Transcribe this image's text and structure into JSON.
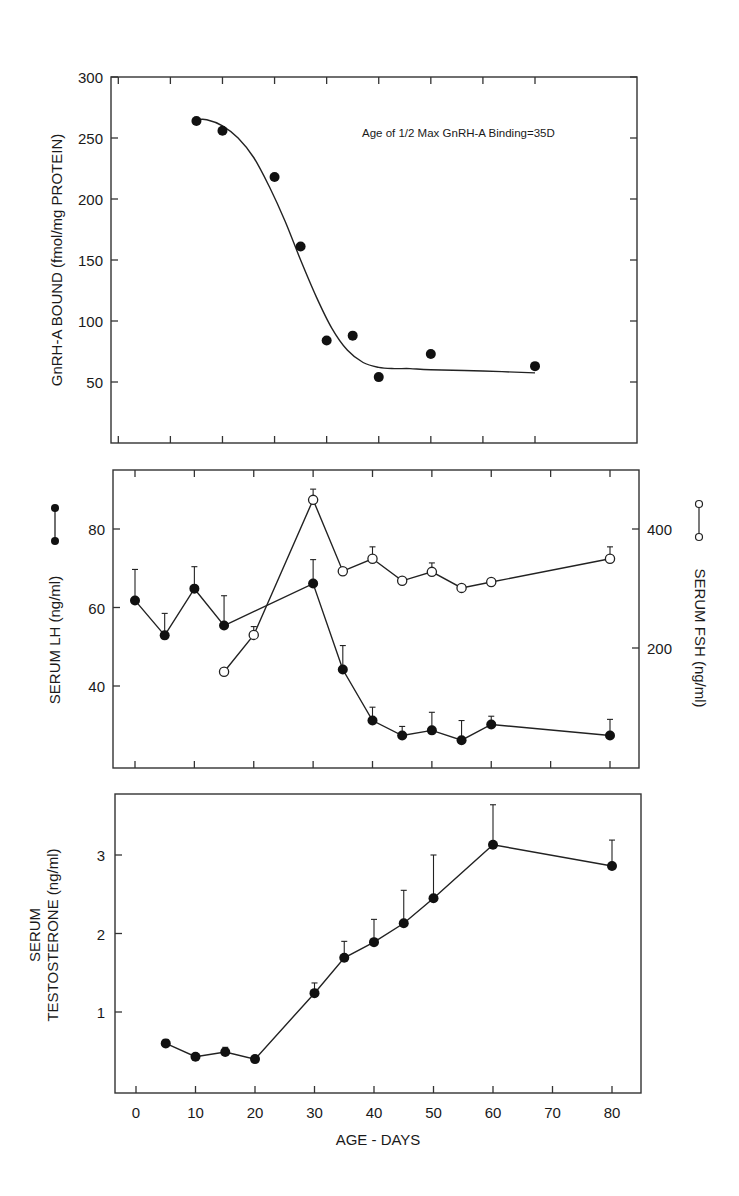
{
  "chart_data": [
    {
      "type": "scatter",
      "panel": "top",
      "title": "",
      "xlabel": "",
      "ylabel": "GnRH-A BOUND (fmol/mg PROTEIN)",
      "ylim": [
        0,
        300
      ],
      "yticks": [
        50,
        100,
        150,
        200,
        250,
        300
      ],
      "xlim": [
        -2,
        99
      ],
      "xticks": [
        0,
        10,
        20,
        30,
        40,
        50,
        60,
        70,
        80
      ],
      "xtick_labels_shown": false,
      "annotation": "Age of 1/2 Max GnRH-A Binding=35D",
      "series": [
        {
          "name": "GnRH-A bound",
          "marker": "filled-circle",
          "x": [
            15,
            20,
            30,
            35,
            40,
            45,
            50,
            60,
            80
          ],
          "values": [
            264,
            256,
            218,
            161,
            84,
            88,
            54,
            73,
            63
          ]
        }
      ],
      "fit_curve": {
        "name": "sigmoid fit",
        "x": [
          15,
          17,
          20,
          23,
          26,
          29,
          32,
          35,
          38,
          41,
          44,
          47,
          50,
          53,
          56,
          60,
          70,
          80
        ],
        "values": [
          265,
          265,
          260,
          250,
          234,
          210,
          182,
          150,
          120,
          94,
          76,
          66,
          62,
          61,
          61,
          60,
          59,
          57.5
        ]
      }
    },
    {
      "type": "line",
      "panel": "middle",
      "title": "",
      "xlabel": "",
      "ylabel": "SERUM LH (ng/ml)",
      "ylabel_right": "SERUM FSH (ng/ml)",
      "ylim": [
        19.3,
        95
      ],
      "yticks": [
        40,
        60,
        80
      ],
      "ylim_right": [
        0,
        500
      ],
      "yticks_right": [
        200,
        400
      ],
      "xticks": [
        0,
        10,
        20,
        30,
        40
      ],
      "series": [
        {
          "name": "SERUM LH",
          "axis": "left",
          "marker": "filled-circle",
          "x": [
            0,
            5,
            10,
            15,
            30,
            35,
            40,
            45,
            50,
            55,
            60,
            80
          ],
          "values": [
            61.8,
            52.9,
            64.8,
            55.4,
            66.1,
            44.2,
            31.2,
            27.4,
            28.7,
            26.2,
            30.2,
            27.4
          ],
          "error_upper": [
            69.7,
            58.5,
            70.4,
            63.0,
            72.2,
            50.3,
            34.6,
            29.7,
            33.3,
            31.2,
            32.3,
            31.5
          ]
        },
        {
          "name": "SERUM FSH",
          "axis": "right",
          "marker": "open-circle",
          "x": [
            15,
            20,
            30,
            35,
            40,
            45,
            50,
            55,
            60,
            80
          ],
          "values": [
            160,
            222,
            449,
            329,
            350,
            313,
            328,
            301,
            311,
            350
          ],
          "error_upper": [
            162,
            236,
            467,
            332,
            370,
            316,
            343,
            305,
            314,
            370
          ]
        }
      ]
    },
    {
      "type": "line",
      "panel": "bottom",
      "title": "",
      "xlabel": "AGE - DAYS",
      "ylabel": "SERUM TESTOSTERONE (ng/ml)",
      "ylim": [
        0,
        3.78
      ],
      "yticks": [
        1,
        2,
        3
      ],
      "xlim": [
        -3.6,
        85
      ],
      "xticks": [
        0,
        10,
        20,
        30,
        40,
        50,
        60,
        70,
        80
      ],
      "series": [
        {
          "name": "SERUM TESTOSTERONE",
          "marker": "filled-circle",
          "x": [
            5,
            10,
            15,
            20,
            30,
            35,
            40,
            45,
            50,
            60,
            80
          ],
          "values": [
            0.6,
            0.43,
            0.49,
            0.4,
            1.24,
            1.69,
            1.89,
            2.13,
            2.45,
            3.13,
            2.86
          ],
          "error_upper": [
            0.65,
            0.47,
            0.55,
            0.42,
            1.37,
            1.9,
            2.18,
            2.55,
            3.0,
            3.64,
            3.19
          ]
        }
      ]
    }
  ],
  "labels": {
    "top_ylabel": "GnRH-A BOUND (fmol/mg PROTEIN)",
    "top_annotation": "Age of 1/2 Max GnRH-A Binding=35D",
    "mid_ylabel_left": "SERUM LH (ng/ml)",
    "mid_ylabel_right": "SERUM FSH (ng/ml)",
    "bot_ylabel_line1": "SERUM",
    "bot_ylabel_line2": "TESTOSTERONE (ng/ml)",
    "xlabel": "AGE - DAYS"
  }
}
